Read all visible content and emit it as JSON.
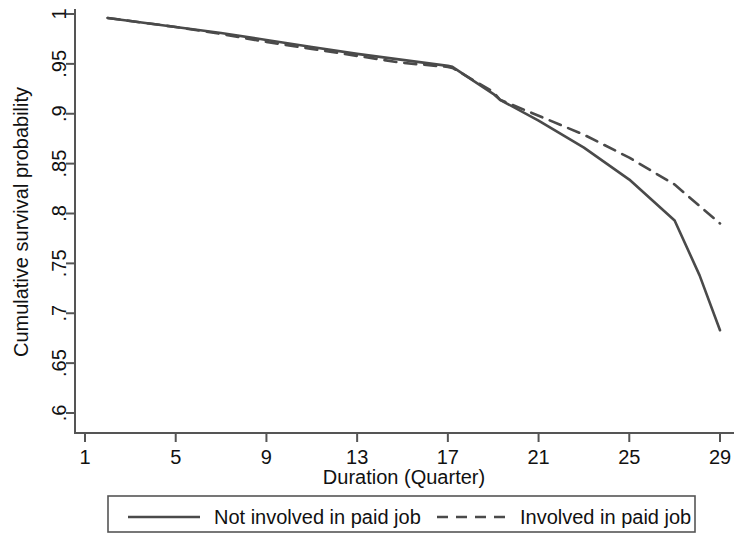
{
  "chart_data": {
    "type": "line",
    "title": "",
    "xlabel": "Duration (Quarter)",
    "ylabel": "Cumulative survival probability",
    "xlim": [
      1,
      29
    ],
    "ylim": [
      0.6,
      1.0
    ],
    "xticks": [
      1,
      5,
      9,
      13,
      17,
      21,
      25,
      29
    ],
    "xtick_labels": [
      "1",
      "5",
      "9",
      "13",
      "17",
      "21",
      "25",
      "29"
    ],
    "yticks": [
      0.6,
      0.65,
      0.7,
      0.75,
      0.8,
      0.85,
      0.9,
      0.95,
      1.0
    ],
    "ytick_labels": [
      ".6",
      ".65",
      ".7",
      ".75",
      ".8",
      ".85",
      ".9",
      ".95",
      "1"
    ],
    "grid": false,
    "legend_position": "bottom",
    "line_color": "#4a4a4a",
    "series": [
      {
        "name": "Not involved in paid job",
        "style": "solid",
        "x": [
          2,
          3,
          5,
          7,
          9,
          11,
          13,
          15,
          17,
          17.2,
          19,
          19.3,
          21,
          23,
          25,
          27,
          28.1,
          29
        ],
        "values": [
          0.996,
          0.993,
          0.987,
          0.981,
          0.974,
          0.967,
          0.96,
          0.954,
          0.948,
          0.947,
          0.92,
          0.914,
          0.893,
          0.866,
          0.834,
          0.793,
          0.738,
          0.683
        ]
      },
      {
        "name": "Involved in paid job",
        "style": "dashed",
        "x": [
          2,
          3,
          5,
          7,
          9,
          11,
          13,
          15,
          17,
          17.2,
          19,
          19.3,
          21,
          23,
          25,
          27,
          29
        ],
        "values": [
          0.996,
          0.993,
          0.987,
          0.98,
          0.972,
          0.965,
          0.958,
          0.951,
          0.947,
          0.946,
          0.922,
          0.914,
          0.898,
          0.879,
          0.856,
          0.829,
          0.79
        ]
      }
    ]
  },
  "legend": {
    "entries": [
      {
        "label": "Not involved in paid job",
        "style": "solid"
      },
      {
        "label": "Involved in paid job",
        "style": "dashed"
      }
    ]
  }
}
